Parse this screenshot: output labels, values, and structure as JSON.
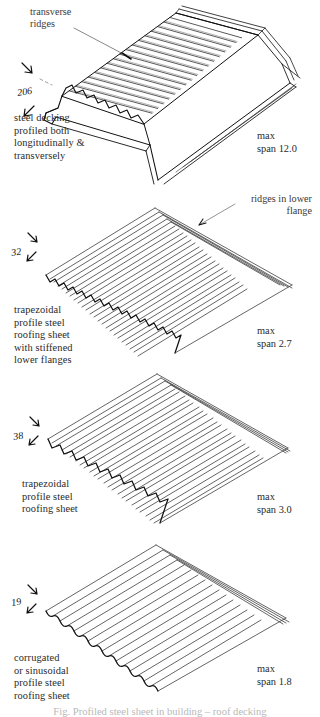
{
  "document": {
    "type": "technical-line-drawing",
    "subject": "profiled steel decking and roofing sheet profiles",
    "bottom_caption": "Fig.  Profiled steel sheet in building – roof decking"
  },
  "panels": [
    {
      "id": "panel-1",
      "profile_name": "steel decking profiled both longitudinally & transversely",
      "caption": "steel decking\nprofiled both\nlongitudinally &\ntransversely",
      "depth_mm": "206",
      "annotation": "transverse\nridges",
      "span_label": "max\nspan 12.0",
      "max_span": "12.0"
    },
    {
      "id": "panel-2",
      "profile_name": "trapezoidal profile steel roofing sheet with stiffened lower flanges",
      "caption": "trapezoidal\nprofile steel\nroofing sheet\nwith stiffened\nlower flanges",
      "depth_mm": "32",
      "annotation": "ridges in lower\nflange",
      "span_label": "max\nspan 2.7",
      "max_span": "2.7"
    },
    {
      "id": "panel-3",
      "profile_name": "trapezoidal profile steel roofing sheet",
      "caption": "trapezoidal\nprofile steel\nroofing sheet",
      "depth_mm": "38",
      "annotation": "",
      "span_label": "max\nspan 3.0",
      "max_span": "3.0"
    },
    {
      "id": "panel-4",
      "profile_name": "corrugated or sinusoidal profile steel roofing sheet",
      "caption": "corrugated\nor sinusoidal\nprofile steel\nroofing sheet",
      "depth_mm": "19",
      "annotation": "",
      "span_label": "max\nspan 1.8",
      "max_span": "1.8"
    }
  ],
  "colors": {
    "ink": "#1a1a1a",
    "text": "#2a2a2a",
    "annotation": "#3a3a3a",
    "faint": "#b9b9b9",
    "paper": "#ffffff"
  }
}
